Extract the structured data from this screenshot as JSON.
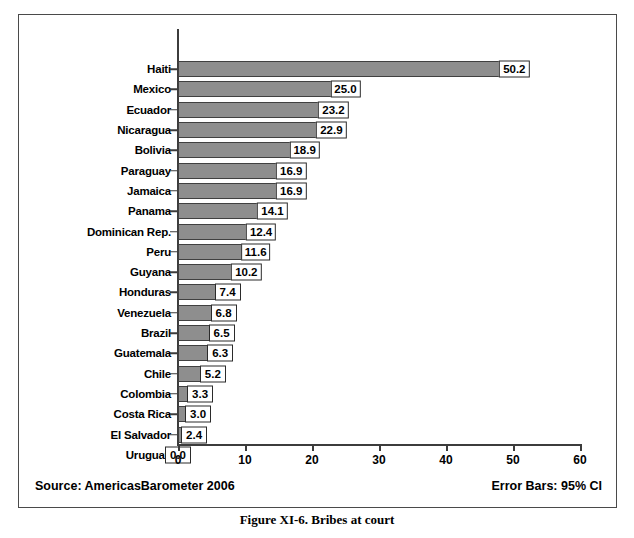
{
  "figure": {
    "caption": "Figure XI-6.  Bribes at court",
    "source_note": "Source: AmericasBarometer  2006",
    "errorbar_note": "Error Bars: 95% CI"
  },
  "chart_data": {
    "type": "bar",
    "orientation": "horizontal",
    "title": "Bribes at court",
    "xlabel": "",
    "ylabel": "",
    "xlim": [
      0,
      60
    ],
    "xticks": [
      0,
      10,
      20,
      30,
      40,
      50,
      60
    ],
    "xtick_labels": [
      "0",
      "10",
      "20",
      "30",
      "40",
      "50",
      "60"
    ],
    "grid": false,
    "legend": null,
    "error_bars": "95% CI",
    "categories": [
      "Haiti",
      "Mexico",
      "Ecuador",
      "Nicaragua",
      "Bolivia",
      "Paraguay",
      "Jamaica",
      "Panama",
      "Dominican Rep.",
      "Peru",
      "Guyana",
      "Honduras",
      "Venezuela",
      "Brazil",
      "Guatemala",
      "Chile",
      "Colombia",
      "Costa Rica",
      "El Salvador",
      "Uruguay"
    ],
    "values": [
      50.2,
      25.0,
      23.2,
      22.9,
      18.9,
      16.9,
      16.9,
      14.1,
      12.4,
      11.6,
      10.2,
      7.4,
      6.8,
      6.5,
      6.3,
      5.2,
      3.3,
      3.0,
      2.4,
      0.0
    ],
    "data_labels": [
      "50.2",
      "25.0",
      "23.2",
      "22.9",
      "18.9",
      "16.9",
      "16.9",
      "14.1",
      "12.4",
      "11.6",
      "10.2",
      "7.4",
      "6.8",
      "6.5",
      "6.3",
      "5.2",
      "3.3",
      "3.0",
      "2.4",
      "0.0"
    ],
    "upper_ci": [
      50.2,
      25.3,
      23.4,
      23.0,
      19.0,
      17.0,
      17.0,
      14.2,
      12.5,
      11.7,
      10.3,
      7.5,
      6.9,
      6.6,
      6.4,
      5.3,
      3.4,
      3.1,
      2.5,
      0.0
    ]
  },
  "colors": {
    "bar_fill": "#8e8e8e",
    "bar_border": "#404040",
    "axis": "#3c3c3c",
    "frame": "#4a4a4a",
    "text": "#000000",
    "label_box_bg": "#ffffff"
  }
}
